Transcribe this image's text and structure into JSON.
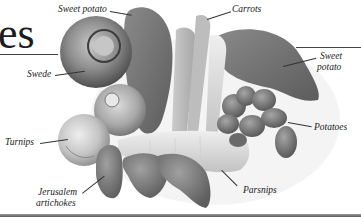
{
  "page": {
    "title_fragment": "es",
    "figure": {
      "description": "Photograph of root vegetables with callout labels",
      "labels": [
        {
          "id": "sweet-potato-top",
          "text": "Sweet potato"
        },
        {
          "id": "carrots",
          "text": "Carrots"
        },
        {
          "id": "sweet-potato-right-1",
          "text": "Sweet"
        },
        {
          "id": "sweet-potato-right-2",
          "text": "potato"
        },
        {
          "id": "swede",
          "text": "Swede"
        },
        {
          "id": "turnips",
          "text": "Turnips"
        },
        {
          "id": "potatoes",
          "text": "Potatoes"
        },
        {
          "id": "jerusalem-1",
          "text": "Jerusalem"
        },
        {
          "id": "jerusalem-2",
          "text": "artichokes"
        },
        {
          "id": "parsnips",
          "text": "Parsnips"
        }
      ]
    }
  },
  "colors": {
    "text": "#222222",
    "rule": "#444444",
    "photo_dark": "#5a5a5a",
    "photo_mid": "#8c8c8c",
    "photo_light": "#d8d8d8"
  }
}
